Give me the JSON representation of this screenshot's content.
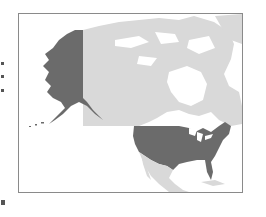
{
  "map": {
    "region": "North America",
    "highlighted_country": "United States",
    "colors": {
      "highlight": "#6b6b6b",
      "land": "#d9d9d9",
      "water": "#ffffff",
      "frame": "#8a8a8a"
    },
    "regions": [
      {
        "name": "United States (contiguous)",
        "state": "highlighted"
      },
      {
        "name": "Alaska",
        "state": "highlighted"
      },
      {
        "name": "Canada",
        "state": "base"
      },
      {
        "name": "Mexico",
        "state": "base"
      },
      {
        "name": "Greenland",
        "state": "base"
      }
    ]
  }
}
